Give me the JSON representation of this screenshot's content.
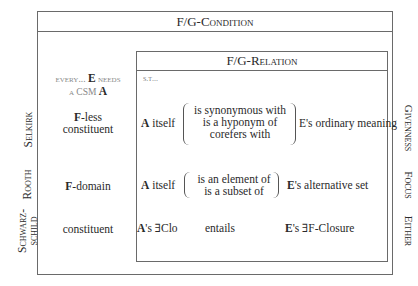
{
  "condition_title": "F/G-Condition",
  "relation_title": "F/G-Relation",
  "st_label": "s.t...",
  "column_header": {
    "line1_pre": "every...",
    "line1_bold": "E",
    "line1_post": "needs",
    "line2_pre": "a CSM",
    "line2_bold": "A"
  },
  "rows": [
    {
      "author": "Selkirk",
      "left_cell_bold": "F",
      "left_cell_rest": "-less",
      "left_cell_line2": "constituent",
      "subject_bold": "A",
      "subject_rest": " itself",
      "relations": [
        "is synonymous with",
        "is a hyponym of",
        "corefers with"
      ],
      "object": "E's ordinary meaning",
      "category": "Givenness"
    },
    {
      "author": "Rooth",
      "left_cell_bold": "F",
      "left_cell_rest": "-domain",
      "subject_bold": "A",
      "subject_rest": " itself",
      "relations": [
        "is an element of",
        "is a subset of"
      ],
      "object_bold": "E",
      "object_rest": "'s alternative set",
      "category": "Focus"
    },
    {
      "author_line1": "Schwarz-",
      "author_line2": "schild",
      "left_cell": "constituent",
      "subject_bold": "A",
      "subject_rest": "'s ∃Clo",
      "relation": "entails",
      "object_bold": "E",
      "object_rest": "'s ∃F-Closure",
      "category": "Either"
    }
  ]
}
